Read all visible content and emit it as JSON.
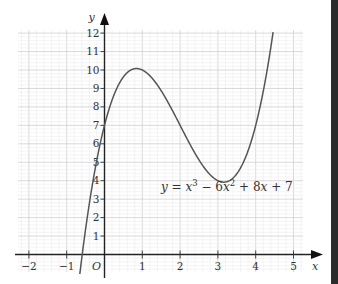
{
  "chart_data": {
    "type": "line",
    "title": "",
    "equation": "y = x^3 - 6x^2 + 8x + 7",
    "equation_label": {
      "y": "y",
      "eq": " = ",
      "x1": "x",
      "p1": "3",
      "m": " − 6",
      "x2": "x",
      "p2": "2",
      "plus8": " + 8",
      "x3": "x",
      "plus7": " + 7"
    },
    "xlabel": "x",
    "ylabel": "y",
    "origin_label": "O",
    "xlim": [
      -2.3,
      5.5
    ],
    "ylim": [
      -0.8,
      12.8
    ],
    "x_ticks": [
      -2,
      -1,
      1,
      2,
      3,
      4,
      5
    ],
    "y_ticks": [
      1,
      2,
      3,
      4,
      5,
      6,
      7,
      8,
      9,
      10,
      11,
      12
    ],
    "grid": true,
    "series": [
      {
        "name": "y = x^3 - 6x^2 + 8x + 7",
        "x": [
          -0.7,
          -0.5,
          0,
          0.5,
          0.845,
          1,
          1.5,
          2,
          2.5,
          3,
          3.155,
          3.5,
          4,
          4.46
        ],
        "y": [
          -1.88,
          1.88,
          7,
          9.63,
          10.08,
          10,
          8.88,
          7,
          5.13,
          4,
          3.92,
          4.38,
          7,
          12.1
        ]
      }
    ],
    "key_points": {
      "local_max": [
        0.85,
        10.1
      ],
      "local_min": [
        3.15,
        3.9
      ],
      "y_intercept": [
        0,
        7
      ]
    }
  }
}
